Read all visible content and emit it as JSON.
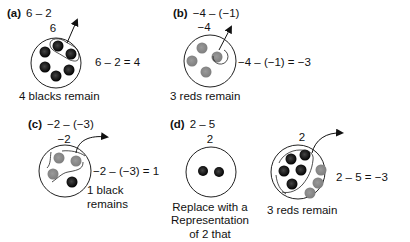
{
  "panels": {
    "a": {
      "label": "(a)",
      "expression": "6 – 2",
      "circle_value": "6",
      "result": "6 – 2 = 4",
      "caption": "4 blacks remain",
      "counters": {
        "black": 6,
        "red": 0
      },
      "removed": {
        "black": 2
      }
    },
    "b": {
      "label": "(b)",
      "expression": "−4 – (−1)",
      "circle_value": "−4",
      "result": "−4 – (−1) = −3",
      "caption": "3 reds remain",
      "counters": {
        "black": 0,
        "red": 4
      },
      "removed": {
        "red": 1
      }
    },
    "c": {
      "label": "(c)",
      "expression": "−2 – (−3)",
      "circle_value": "−2",
      "result": "−2 – (−3) = 1",
      "caption_line1": "1 black",
      "caption_line2": "remains",
      "counters": {
        "black": 1,
        "red": 3
      },
      "removed": {
        "red": 3
      }
    },
    "d": {
      "label": "(d)",
      "expression": "2 – 5",
      "circle_value": "2",
      "caption_line1": "Replace with a",
      "caption_line2": "Representation",
      "caption_line3": "of 2 that",
      "counters": {
        "black": 2,
        "red": 0
      },
      "replaced": {
        "circle_value": "2",
        "result": "2 – 5 = −3",
        "caption": "3 reds remain",
        "counters": {
          "black": 5,
          "red": 3
        },
        "removed": {
          "black": 5
        }
      }
    }
  },
  "colors": {
    "black_counter": "#1a1a1a",
    "red_counter": "#8c8c8c",
    "outline": "#222222"
  }
}
